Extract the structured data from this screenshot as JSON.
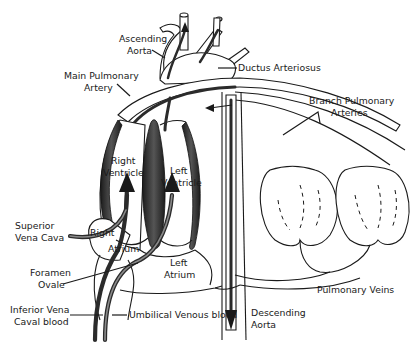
{
  "diagram": {
    "colors": {
      "line": "#1a1a1a",
      "flow": "#2b2b2b",
      "wall": "#3a3a3a",
      "background": "#ffffff"
    },
    "labels": {
      "ascending_aorta_1": "Ascending",
      "ascending_aorta_2": "Aorta",
      "ductus_arteriosus": "Ductus Arteriosus",
      "main_pulmonary_artery_1": "Main Pulmonary",
      "main_pulmonary_artery_2": "Artery",
      "branch_pulmonary_arteries_1": "Branch Pulmonary",
      "branch_pulmonary_arteries_2": "Arteries",
      "right_ventricle_1": "Right",
      "right_ventricle_2": "Ventricle",
      "left_ventricle_1": "Left",
      "left_ventricle_2": "Ventricle",
      "superior_vena_cava_1": "Superior",
      "superior_vena_cava_2": "Vena  Cava",
      "right_atrium_1": "Right",
      "right_atrium_2": "Atrium",
      "foramen_ovale_1": "Foramen",
      "foramen_ovale_2": "Ovale",
      "left_atrium_1": "Left",
      "left_atrium_2": "Atrium",
      "inferior_vena_cava_1": "Inferior Vena",
      "inferior_vena_cava_2": "Caval blood",
      "umbilical_venous_blood": "Umbilical Venous blood",
      "descending_aorta_1": "Descending",
      "descending_aorta_2": "Aorta",
      "pulmonary_veins": "Pulmonary Veins"
    }
  }
}
